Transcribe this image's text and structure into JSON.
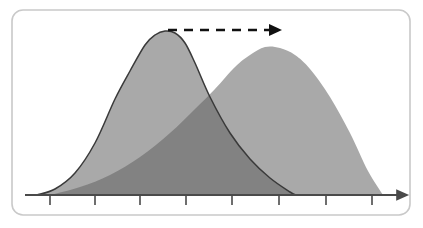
{
  "figure": {
    "title": "Overlapping distribution curves with rightward shift arrow",
    "background_color": "#ffffff",
    "frame": {
      "name": "rounded-frame",
      "x": 12,
      "y": 10,
      "width": 398,
      "height": 205,
      "corner_radius": 11,
      "stroke_color": "#c9c9c9",
      "stroke_width": 1.6,
      "fill_color": "#ffffff"
    },
    "colors": {
      "curve_fill_light": "#a9a9a9",
      "curve_overlap_dark": "#828282",
      "curve_outline": "#3a3a3a",
      "axis": "#4a4a4a",
      "arrow": "#111111",
      "frame_border": "#c9c9c9"
    }
  },
  "chart_data": {
    "type": "area",
    "title": "",
    "subtitle": "",
    "xlabel": "",
    "ylabel": "",
    "grid": false,
    "legend": null,
    "axis": {
      "name": "x-axis",
      "baseline_y": 195,
      "x_start": 25,
      "x_end": 400,
      "has_arrowhead": true,
      "tick_positions": [
        50,
        95,
        140,
        186,
        232,
        279,
        326,
        372
      ],
      "tick_labels": [
        "",
        "",
        "",
        "",
        "",
        "",
        "",
        ""
      ],
      "tick_length": 9,
      "y_axis_visible": false
    },
    "xlim": [
      25,
      400
    ],
    "ylim": [
      0,
      165
    ],
    "series": [
      {
        "name": "original-distribution",
        "label": "",
        "fill": "#a9a9a9",
        "outlined": true,
        "outline_color": "#3a3a3a",
        "peak_x": 165,
        "peak_y": 31,
        "peak_height": 164,
        "left_tail_x": 37,
        "right_tail_x": 296,
        "mean": 165,
        "sigma": 48,
        "skew": 0.55,
        "x": [
          37,
          55,
          75,
          95,
          115,
          130,
          145,
          155,
          165,
          175,
          185,
          195,
          210,
          230,
          250,
          270,
          290,
          296
        ],
        "y": [
          0,
          6,
          22,
          52,
          96,
          124,
          150,
          160,
          164,
          162,
          152,
          132,
          98,
          62,
          36,
          17,
          3,
          0
        ]
      },
      {
        "name": "shifted-distribution",
        "label": "",
        "fill": "#a9a9a9",
        "outlined": false,
        "outline_color": "",
        "peak_x": 265,
        "peak_y": 47,
        "peak_height": 148,
        "left_tail_x": 50,
        "right_tail_x": 383,
        "mean": 265,
        "sigma": 58,
        "skew": -0.35,
        "x": [
          50,
          80,
          110,
          140,
          170,
          195,
          215,
          235,
          250,
          265,
          280,
          295,
          310,
          330,
          350,
          368,
          383
        ],
        "y": [
          0,
          8,
          20,
          38,
          62,
          86,
          106,
          128,
          140,
          148,
          147,
          140,
          126,
          98,
          62,
          24,
          0
        ]
      }
    ],
    "overlap_region": {
      "name": "overlap-area",
      "fill": "#828282",
      "x_start": 50,
      "x_end": 296,
      "description": "intersection of both distribution areas"
    },
    "annotations": [
      {
        "name": "shift-arrow",
        "type": "dashed-arrow",
        "label": "",
        "x_start": 168,
        "y_start": 30,
        "x_end": 276,
        "y_end": 30,
        "color": "#111111",
        "stroke_width": 2.4,
        "dash_pattern": "9 7",
        "dash_count": 7,
        "arrowhead": "solid-triangle",
        "direction": "right"
      }
    ]
  }
}
